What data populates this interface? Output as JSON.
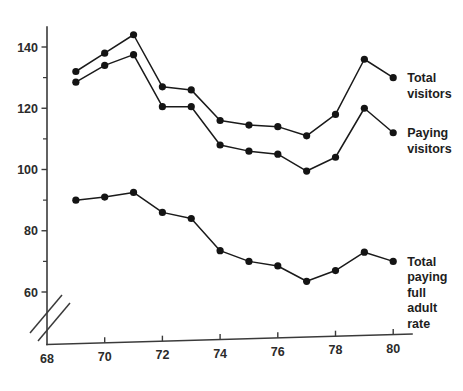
{
  "chart_data": {
    "type": "line",
    "title": "",
    "subtitle": "",
    "xlabel": "",
    "ylabel": "",
    "x": [
      69,
      70,
      71,
      72,
      73,
      74,
      75,
      76,
      77,
      78,
      79,
      80
    ],
    "xlim": [
      68,
      80.5
    ],
    "ylim": [
      58,
      148
    ],
    "grid": false,
    "axis_break": true,
    "axis_break_position": "y-axis below 60",
    "legend_position": "right-of-last-point",
    "x_ticks_major": [
      68,
      70,
      72,
      74,
      76,
      78,
      80
    ],
    "x_tick_labels": [
      "68",
      "70",
      "72",
      "74",
      "76",
      "78",
      "80"
    ],
    "x_ticks_minor": [
      69,
      71,
      73,
      75,
      77,
      79
    ],
    "y_ticks_major": [
      60,
      80,
      100,
      120,
      140
    ],
    "y_tick_labels": [
      "60",
      "80",
      "100",
      "120",
      "140"
    ],
    "y_ticks_minor": [
      70,
      90,
      110,
      130
    ],
    "series": [
      {
        "name": "Total visitors",
        "label_lines": [
          "Total",
          "visitors"
        ],
        "color": "#141414",
        "marker": "circle",
        "values": [
          132,
          138,
          144,
          127,
          126,
          116,
          114.5,
          114,
          111,
          118,
          136,
          130
        ]
      },
      {
        "name": "Paying visitors",
        "label_lines": [
          "Paying",
          "visitors"
        ],
        "color": "#141414",
        "marker": "circle",
        "values": [
          128.5,
          134,
          137.5,
          120.5,
          120.5,
          108,
          106,
          105,
          99.5,
          104,
          120,
          112
        ]
      },
      {
        "name": "Total paying full adult rate",
        "label_lines": [
          "Total",
          "paying",
          "full",
          "adult",
          "rate"
        ],
        "color": "#141414",
        "marker": "circle",
        "values": [
          90,
          91,
          92.5,
          86,
          84,
          73.5,
          70,
          68.5,
          63.5,
          67,
          73,
          70
        ]
      }
    ]
  }
}
